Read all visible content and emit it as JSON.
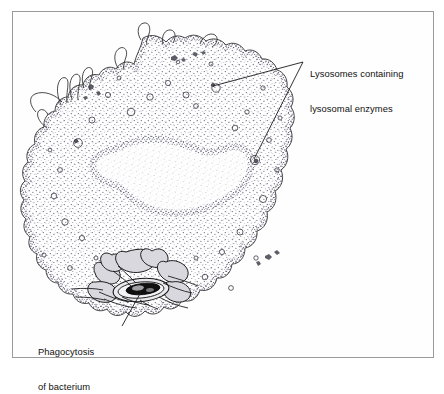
{
  "figure": {
    "frame_color": "#9a9a9a",
    "background_color": "#ffffff",
    "ink_color": "#1a1a1a",
    "stipple_color": "#6e6e82"
  },
  "labels": {
    "lysosomes": {
      "line1": "Lysosomes containing",
      "line2": "lysosomal enzymes"
    },
    "phagocytosis": {
      "line1": "Phagocytosis",
      "line2": "of bacterium"
    }
  },
  "structures": {
    "cell_membrane": "ruffled plasma membrane with pseudopodia",
    "cytoplasm": "stippled cytoplasm",
    "nucleus": "kidney-shaped nucleus",
    "lysosome_vesicles": "small granular lysosomes",
    "bacterium": "engulfed bacterium",
    "phagosome": "phagocytic vacuole"
  },
  "leader_lines": {
    "lysosome_upper_target": "cytoplasmic lysosome near top of cell",
    "lysosome_lower_target": "cytoplasmic lysosome at right of cell",
    "bacterium_target": "bacterium within phagosome"
  }
}
